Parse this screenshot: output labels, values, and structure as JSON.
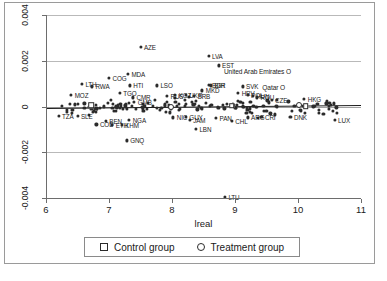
{
  "chart_data": {
    "type": "scatter",
    "title": "",
    "xlabel": "lreal",
    "ylabel": "",
    "xlim": [
      6,
      11
    ],
    "ylim": [
      -0.004,
      0.004
    ],
    "xticks": [
      "6",
      "7",
      "8",
      "9",
      "10",
      "11"
    ],
    "yticks": [
      "0.004",
      "0.002",
      "0",
      "-0.002",
      "-0.004"
    ],
    "grid": "horizontal",
    "legend_position": "below-axis",
    "reference_line": {
      "y_left": -5e-05,
      "y_right": 8e-05,
      "description": "fitted near-flat line"
    },
    "legend": [
      {
        "label": "Control group",
        "marker": "square-open"
      },
      {
        "label": "Treatment group",
        "marker": "circle-open"
      }
    ],
    "series": [
      {
        "name": "countries",
        "marker": "circle-filled",
        "points": [
          {
            "label": "AZE",
            "x": 7.5,
            "y": 0.00262,
            "lpos": "right"
          },
          {
            "label": "LVA",
            "x": 8.58,
            "y": 0.00222,
            "lpos": "right"
          },
          {
            "label": "EST",
            "x": 8.74,
            "y": 0.0018,
            "lpos": "right"
          },
          {
            "label": "United Arab Emirates O",
            "x": 8.84,
            "y": 0.00155,
            "lpos": "plain"
          },
          {
            "label": "MDA",
            "x": 7.3,
            "y": 0.00142,
            "lpos": "right"
          },
          {
            "label": "COG",
            "x": 7.0,
            "y": 0.00124,
            "lpos": "right"
          },
          {
            "label": "LTH",
            "x": 6.57,
            "y": 0.00098,
            "lpos": "right"
          },
          {
            "label": "RWA",
            "x": 6.73,
            "y": 0.00088,
            "lpos": "right"
          },
          {
            "label": "HTI",
            "x": 7.33,
            "y": 0.00092,
            "lpos": "right"
          },
          {
            "label": "LSO",
            "x": 7.76,
            "y": 0.00092,
            "lpos": "right"
          },
          {
            "label": "BGR",
            "x": 8.58,
            "y": 0.00096,
            "lpos": "right"
          },
          {
            "label": "BIH",
            "x": 8.62,
            "y": 0.00092,
            "lpos": "right"
          },
          {
            "label": "SVK",
            "x": 9.12,
            "y": 0.00088,
            "lpos": "right"
          },
          {
            "label": "Qatar O",
            "x": 9.45,
            "y": 0.00086,
            "lpos": "plain"
          },
          {
            "label": "MKD",
            "x": 8.48,
            "y": 0.0007,
            "lpos": "right"
          },
          {
            "label": "TGO",
            "x": 7.17,
            "y": 0.00058,
            "lpos": "right"
          },
          {
            "label": "MOZ",
            "x": 6.4,
            "y": 0.0005,
            "lpos": "right"
          },
          {
            "label": "CMR",
            "x": 7.38,
            "y": 0.0004,
            "lpos": "right"
          },
          {
            "label": "RUS",
            "x": 7.92,
            "y": 0.00046,
            "lpos": "right"
          },
          {
            "label": "KGZ",
            "x": 8.05,
            "y": 0.0005,
            "lpos": "right"
          },
          {
            "label": "UKR",
            "x": 8.22,
            "y": 0.00052,
            "lpos": "right"
          },
          {
            "label": "SRB",
            "x": 8.35,
            "y": 0.00048,
            "lpos": "right"
          },
          {
            "label": "HRV",
            "x": 9.05,
            "y": 0.0006,
            "lpos": "right"
          },
          {
            "label": "POL",
            "x": 9.2,
            "y": 0.00052,
            "lpos": "right"
          },
          {
            "label": "HUN",
            "x": 9.28,
            "y": 0.00046,
            "lpos": "right"
          },
          {
            "label": "ROU",
            "x": 9.35,
            "y": 0.0004,
            "lpos": "right"
          },
          {
            "label": "CZE",
            "x": 9.58,
            "y": 0.0003,
            "lpos": "right"
          },
          {
            "label": "HKG",
            "x": 10.1,
            "y": 0.00032,
            "lpos": "right"
          },
          {
            "label": "GMB",
            "x": 7.4,
            "y": 0.0002,
            "lpos": "right"
          },
          {
            "label": "TZA",
            "x": 6.2,
            "y": -0.0004,
            "lpos": "right"
          },
          {
            "label": "SLE",
            "x": 6.5,
            "y": -0.00042,
            "lpos": "right"
          },
          {
            "label": "BEN",
            "x": 6.95,
            "y": -0.00062,
            "lpos": "right"
          },
          {
            "label": "COD",
            "x": 6.8,
            "y": -0.00078,
            "lpos": "right"
          },
          {
            "label": "ETH",
            "x": 7.05,
            "y": -0.00082,
            "lpos": "right"
          },
          {
            "label": "KHM",
            "x": 7.2,
            "y": -0.0008,
            "lpos": "right"
          },
          {
            "label": "NGA",
            "x": 7.32,
            "y": -0.0006,
            "lpos": "right"
          },
          {
            "label": "GNQ",
            "x": 7.28,
            "y": -0.00148,
            "lpos": "right"
          },
          {
            "label": "NIC",
            "x": 8.02,
            "y": -0.00048,
            "lpos": "right"
          },
          {
            "label": "GUY",
            "x": 8.22,
            "y": -0.00044,
            "lpos": "right"
          },
          {
            "label": "JAM",
            "x": 8.28,
            "y": -0.00058,
            "lpos": "right"
          },
          {
            "label": "LBN",
            "x": 8.38,
            "y": -0.00098,
            "lpos": "right"
          },
          {
            "label": "PAN",
            "x": 8.7,
            "y": -0.0005,
            "lpos": "right"
          },
          {
            "label": "CHL",
            "x": 8.95,
            "y": -0.00062,
            "lpos": "right"
          },
          {
            "label": "ARG",
            "x": 9.2,
            "y": -0.00048,
            "lpos": "right"
          },
          {
            "label": "CRI",
            "x": 9.42,
            "y": -0.00044,
            "lpos": "right"
          },
          {
            "label": "DNK",
            "x": 9.88,
            "y": -0.00046,
            "lpos": "right"
          },
          {
            "label": "LUX",
            "x": 10.58,
            "y": -0.0006,
            "lpos": "right"
          },
          {
            "label": "LTU",
            "x": 8.84,
            "y": -0.00395,
            "lpos": "right"
          }
        ],
        "unlabeled_cloud": "≈140 additional points densely clustered between x=6.2 and x=10.6 near y=0 (|y| < 0.0005)"
      }
    ]
  },
  "axis": {
    "x_title": "lreal"
  },
  "legend": {
    "control": "Control group",
    "treatment": "Treatment group"
  }
}
